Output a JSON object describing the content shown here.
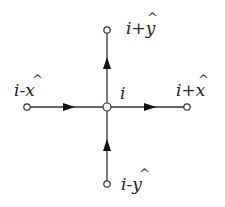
{
  "diagram": {
    "title": "",
    "colors": {
      "line": "#333333",
      "node_fill": "#ffffff",
      "text": "#222222"
    },
    "nodes": {
      "center": {
        "label": "i",
        "x": 107,
        "y": 107
      },
      "top": {
        "label": "i+ŷ",
        "x": 107,
        "y": 30
      },
      "bottom": {
        "label": "i-ŷ",
        "x": 107,
        "y": 184
      },
      "left": {
        "label": "i-x̂",
        "x": 27,
        "y": 107
      },
      "right": {
        "label": "i+x̂",
        "x": 187,
        "y": 107
      }
    },
    "labels": {
      "center": "i",
      "top_base": "i+y",
      "bottom_base": "i-y",
      "left_base": "i-x",
      "right_base": "i+x",
      "hat": "^"
    },
    "edges": [
      {
        "from": "left",
        "to": "center",
        "arrow": "right"
      },
      {
        "from": "center",
        "to": "right",
        "arrow": "right"
      },
      {
        "from": "bottom",
        "to": "center",
        "arrow": "up"
      },
      {
        "from": "center",
        "to": "top",
        "arrow": "up"
      }
    ]
  }
}
